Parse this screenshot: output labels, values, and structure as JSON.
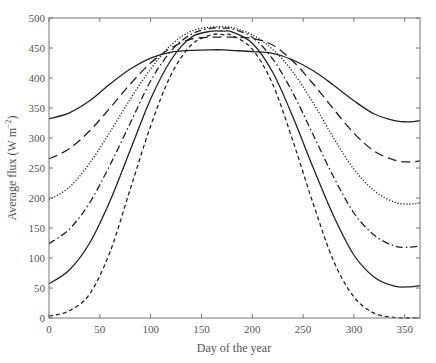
{
  "chart_data": {
    "type": "line",
    "title": "",
    "xlabel": "Day of the year",
    "ylabel": "Average flux (W m^-2)",
    "xlim": [
      0,
      365
    ],
    "ylim": [
      0,
      500
    ],
    "xticks": [
      0,
      50,
      100,
      150,
      200,
      250,
      300,
      350
    ],
    "yticks": [
      0,
      50,
      100,
      150,
      200,
      250,
      300,
      350,
      400,
      450,
      500
    ],
    "grid": false,
    "legend": null,
    "x": [
      0,
      20,
      40,
      60,
      80,
      100,
      120,
      140,
      160,
      172,
      180,
      200,
      220,
      240,
      260,
      280,
      300,
      320,
      340,
      355,
      365
    ],
    "series": [
      {
        "name": "curve-1-solid-top",
        "style": "solid",
        "values": [
          332,
          342,
          362,
          390,
          415,
          433,
          443,
          446,
          447,
          447,
          446,
          444,
          441,
          430,
          412,
          388,
          362,
          340,
          329,
          327,
          329
        ]
      },
      {
        "name": "curve-2-long-dash",
        "style": "longdash",
        "values": [
          265,
          282,
          312,
          350,
          390,
          425,
          450,
          465,
          468,
          468,
          468,
          466,
          455,
          428,
          390,
          348,
          308,
          278,
          263,
          260,
          262
        ]
      },
      {
        "name": "curve-3-dotted",
        "style": "dotted",
        "values": [
          197,
          218,
          258,
          310,
          365,
          415,
          455,
          478,
          485,
          485,
          484,
          472,
          448,
          410,
          358,
          300,
          248,
          212,
          193,
          190,
          192
        ]
      },
      {
        "name": "curve-4-dash-dot",
        "style": "dashdot",
        "values": [
          124,
          148,
          192,
          255,
          325,
          395,
          445,
          473,
          483,
          483,
          482,
          468,
          432,
          375,
          305,
          235,
          175,
          138,
          120,
          118,
          120
        ]
      },
      {
        "name": "curve-5-solid-bottom",
        "style": "solid",
        "values": [
          57,
          80,
          125,
          195,
          280,
          365,
          430,
          468,
          478,
          478,
          477,
          458,
          410,
          335,
          250,
          170,
          105,
          68,
          53,
          52,
          54
        ]
      },
      {
        "name": "curve-6-short-dash",
        "style": "dash",
        "values": [
          3,
          12,
          40,
          110,
          215,
          320,
          405,
          455,
          472,
          472,
          471,
          448,
          390,
          295,
          190,
          95,
          35,
          8,
          1,
          0,
          1
        ]
      }
    ]
  },
  "axes": {
    "xlabel": "Day of the year",
    "ylabel_main": "Average flux (W m",
    "ylabel_sup": "−2",
    "ylabel_end": ")"
  }
}
